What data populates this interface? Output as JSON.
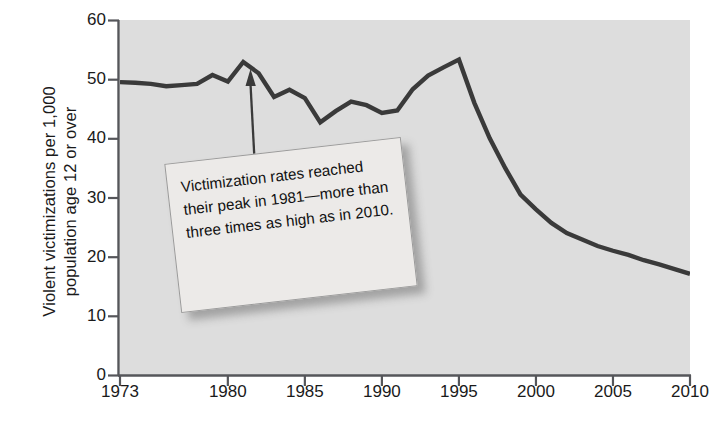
{
  "chart_data": {
    "type": "line",
    "title": "",
    "subtitle": "",
    "xlabel": "",
    "ylabel": "Violent victimizations per 1,000\npopulation age 12 or over",
    "xlim": [
      1973,
      2010
    ],
    "ylim": [
      0,
      60
    ],
    "grid": false,
    "legend": null,
    "line_color": "#3a3a3a",
    "plot_background": "#dddddd",
    "xticks": [
      "1973",
      "1980",
      "1985",
      "1990",
      "1995",
      "2000",
      "2005",
      "2010"
    ],
    "xtick_values": [
      1973,
      1980,
      1985,
      1990,
      1995,
      2000,
      2005,
      2010
    ],
    "yticks": [
      "0",
      "10",
      "20",
      "30",
      "40",
      "50",
      "60"
    ],
    "ytick_values": [
      0,
      10,
      20,
      30,
      40,
      50,
      60
    ],
    "x": [
      1973,
      1974,
      1975,
      1976,
      1977,
      1978,
      1979,
      1980,
      1981,
      1982,
      1983,
      1984,
      1985,
      1986,
      1987,
      1988,
      1989,
      1990,
      1991,
      1992,
      1993,
      1994,
      1995,
      1996,
      1997,
      1998,
      1999,
      2000,
      2001,
      2002,
      2003,
      2004,
      2005,
      2006,
      2007,
      2008,
      2009,
      2010
    ],
    "values": [
      49.5,
      49.4,
      49.2,
      48.8,
      49.0,
      49.2,
      50.7,
      49.6,
      52.9,
      51.0,
      47.0,
      48.2,
      46.8,
      42.7,
      44.6,
      46.2,
      45.6,
      44.3,
      44.7,
      48.3,
      50.6,
      52.0,
      53.3,
      46.0,
      40.0,
      35.0,
      30.5,
      28.0,
      25.7,
      24.0,
      22.9,
      21.8,
      21.0,
      20.3,
      19.4,
      18.7,
      17.9,
      17.1
    ],
    "annotations": [
      {
        "text": "Victimization rates reached their peak in 1981—more than three times as high as in 2010.",
        "points_to_x": 1981,
        "points_to_y": 52.9,
        "style": "callout-box-with-arrow"
      }
    ]
  },
  "axis": {
    "y_title": "Violent victimizations per 1,000\npopulation age 12 or over"
  },
  "callout": {
    "text": "Victimization rates reached their peak in 1981—more than three times as high as in 2010."
  }
}
